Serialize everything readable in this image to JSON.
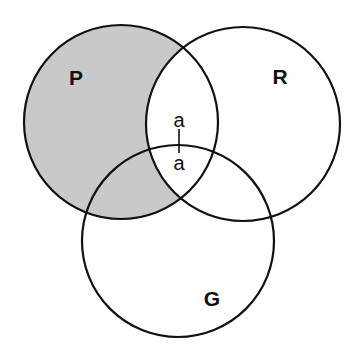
{
  "diagram": {
    "type": "venn-3",
    "colors": {
      "background": "#ffffff",
      "stroke": "#111111",
      "shade": "#c9c9c9",
      "text": "#111111"
    },
    "sets": [
      {
        "id": "P",
        "label": "P",
        "cx": 121,
        "cy": 122,
        "r": 97,
        "label_x": 76,
        "label_y": 85
      },
      {
        "id": "R",
        "label": "R",
        "cx": 243,
        "cy": 124,
        "r": 97,
        "label_x": 280,
        "label_y": 84
      },
      {
        "id": "G",
        "label": "G",
        "cx": 178,
        "cy": 241,
        "r": 96,
        "label_x": 212,
        "label_y": 306
      }
    ],
    "shaded_region": "P minus R",
    "elements": [
      {
        "label": "a",
        "x": 179,
        "y": 127,
        "region": "P ∩ R, outside G"
      },
      {
        "label": "a",
        "x": 179,
        "y": 170,
        "region": "P ∩ R ∩ G"
      }
    ],
    "connector": {
      "x": 179,
      "y1": 129,
      "y2": 153,
      "meaning": "element straddles the G boundary within P ∩ R"
    }
  }
}
